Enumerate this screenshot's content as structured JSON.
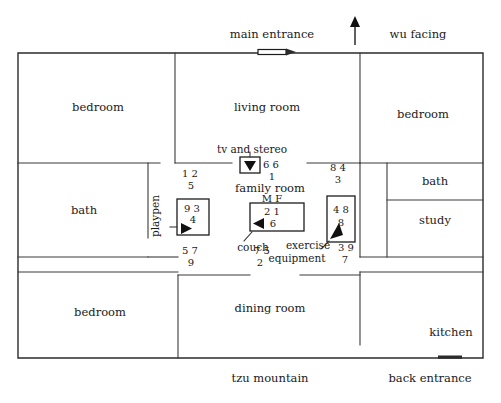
{
  "diagram": {
    "edge_labels": {
      "top_left": "main entrance",
      "top_right": "wu facing",
      "bottom_left": "tzu mountain",
      "bottom_right": "back entrance"
    },
    "compass_arrow": {
      "name": "north-arrow",
      "direction": "up"
    },
    "rooms": [
      {
        "id": "bedroom-top-left",
        "label": "bedroom"
      },
      {
        "id": "living-room",
        "label": "living room"
      },
      {
        "id": "bedroom-top-right",
        "label": "bedroom"
      },
      {
        "id": "bath-left",
        "label": "bath"
      },
      {
        "id": "bath-right",
        "label": "bath"
      },
      {
        "id": "study",
        "label": "study"
      },
      {
        "id": "family-room",
        "label": "family room"
      },
      {
        "id": "bedroom-bottom-left",
        "label": "bedroom"
      },
      {
        "id": "dining-room",
        "label": "dining room"
      },
      {
        "id": "kitchen",
        "label": "kitchen"
      }
    ],
    "furniture": [
      {
        "id": "playpen",
        "label": "playpen",
        "orientation": "vertical"
      },
      {
        "id": "tv-and-stereo",
        "label": "tv and stereo"
      },
      {
        "id": "couch",
        "label": "couch"
      },
      {
        "id": "exercise-equipment",
        "label": "exercise equipment"
      }
    ],
    "sector_markers": {
      "mf_header": "M  F",
      "groups": [
        {
          "id": "grid-top-left",
          "top": "1  2",
          "bottom": "5"
        },
        {
          "id": "grid-top-center",
          "top": "6  6",
          "bottom": "1"
        },
        {
          "id": "grid-top-right",
          "top": "8  4",
          "bottom": "3"
        },
        {
          "id": "grid-playpen",
          "top": "9  3",
          "bottom": "4"
        },
        {
          "id": "grid-couch",
          "top": "2  1",
          "bottom": "6"
        },
        {
          "id": "grid-exercise",
          "top": "4  8",
          "bottom": "8"
        },
        {
          "id": "grid-bottom-left",
          "top": "5  7",
          "bottom": "9"
        },
        {
          "id": "grid-bottom-center",
          "top": "7  5",
          "bottom": "2"
        },
        {
          "id": "grid-bottom-right",
          "top": "3  9",
          "bottom": "7"
        }
      ]
    },
    "colors": {
      "wall": "#2b2b2b",
      "text": "#1a1a1a",
      "background": "#ffffff"
    }
  }
}
